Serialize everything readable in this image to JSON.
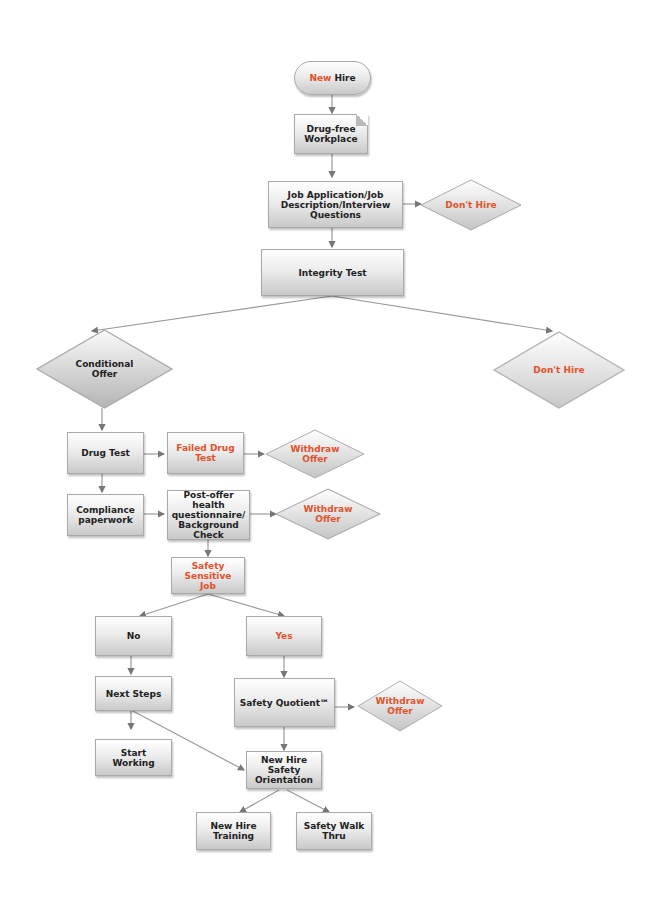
{
  "diagram": {
    "type": "flowchart",
    "accent_color": "#e2522b",
    "text_color": "#222222",
    "nodes": {
      "new_hire": {
        "prefix": "New",
        "suffix": " Hire",
        "shape": "terminator"
      },
      "drug_free": {
        "label": "Drug-free Workplace",
        "shape": "document"
      },
      "job_app": {
        "label": "Job Application/Job Description/Interview Questions",
        "shape": "process"
      },
      "dont_hire_1": {
        "label": "Don't Hire",
        "shape": "decision"
      },
      "integrity": {
        "label": "Integrity Test",
        "shape": "process"
      },
      "conditional": {
        "label": "Conditional Offer",
        "shape": "decision"
      },
      "dont_hire_2": {
        "label": "Don't Hire",
        "shape": "decision"
      },
      "drug_test": {
        "label": "Drug Test",
        "shape": "process"
      },
      "failed_drug": {
        "label": "Failed Drug Test",
        "shape": "process"
      },
      "withdraw_1": {
        "label": "Withdraw Offer",
        "shape": "decision"
      },
      "compliance": {
        "label": "Compliance paperwork",
        "shape": "process"
      },
      "post_offer": {
        "label": "Post-offer health questionnaire/ Background Check",
        "shape": "process"
      },
      "withdraw_2": {
        "label": "Withdraw Offer",
        "shape": "decision"
      },
      "safety_sensitive": {
        "label": "Safety Sensitive Job",
        "shape": "process"
      },
      "no": {
        "label": "No",
        "shape": "process"
      },
      "yes": {
        "label": "Yes",
        "shape": "process"
      },
      "next_steps": {
        "label": "Next Steps",
        "shape": "process"
      },
      "safety_quotient": {
        "label": "Safety Quotient℠",
        "shape": "process"
      },
      "withdraw_3": {
        "label": "Withdraw Offer",
        "shape": "decision"
      },
      "start_working": {
        "label": "Start Working",
        "shape": "process"
      },
      "nh_orientation": {
        "label": "New Hire Safety Orientation",
        "shape": "process"
      },
      "nh_training": {
        "label": "New Hire Training",
        "shape": "process"
      },
      "walk_thru": {
        "label": "Safety Walk Thru",
        "shape": "process"
      }
    },
    "edges": [
      [
        "new_hire",
        "drug_free"
      ],
      [
        "drug_free",
        "job_app"
      ],
      [
        "job_app",
        "dont_hire_1"
      ],
      [
        "job_app",
        "integrity"
      ],
      [
        "integrity",
        "conditional"
      ],
      [
        "integrity",
        "dont_hire_2"
      ],
      [
        "conditional",
        "drug_test"
      ],
      [
        "drug_test",
        "failed_drug"
      ],
      [
        "failed_drug",
        "withdraw_1"
      ],
      [
        "drug_test",
        "compliance"
      ],
      [
        "compliance",
        "post_offer"
      ],
      [
        "post_offer",
        "withdraw_2"
      ],
      [
        "post_offer",
        "safety_sensitive"
      ],
      [
        "safety_sensitive",
        "no"
      ],
      [
        "safety_sensitive",
        "yes"
      ],
      [
        "no",
        "next_steps"
      ],
      [
        "next_steps",
        "start_working"
      ],
      [
        "next_steps",
        "nh_orientation"
      ],
      [
        "yes",
        "safety_quotient"
      ],
      [
        "safety_quotient",
        "withdraw_3"
      ],
      [
        "safety_quotient",
        "nh_orientation"
      ],
      [
        "nh_orientation",
        "nh_training"
      ],
      [
        "nh_orientation",
        "walk_thru"
      ]
    ]
  }
}
